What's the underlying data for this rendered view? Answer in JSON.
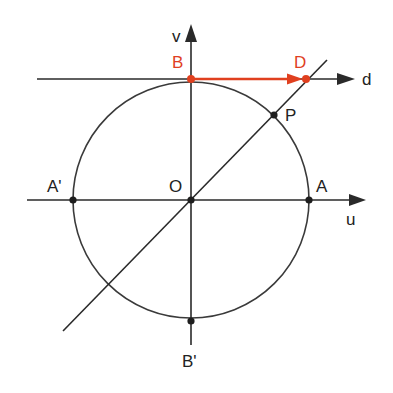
{
  "diagram": {
    "colors": {
      "line": "#2a2a2a",
      "accent": "#e0401f",
      "point": "#1e1e1e",
      "background": "#ffffff"
    },
    "axes": {
      "u": {
        "label": "u"
      },
      "v": {
        "label": "v"
      },
      "d": {
        "label": "d"
      }
    },
    "points": {
      "O": {
        "label": "O"
      },
      "A": {
        "label": "A"
      },
      "A_prime": {
        "label": "A'"
      },
      "B": {
        "label": "B"
      },
      "B_prime": {
        "label": "B'"
      },
      "D": {
        "label": "D"
      },
      "P": {
        "label": "P"
      }
    }
  }
}
